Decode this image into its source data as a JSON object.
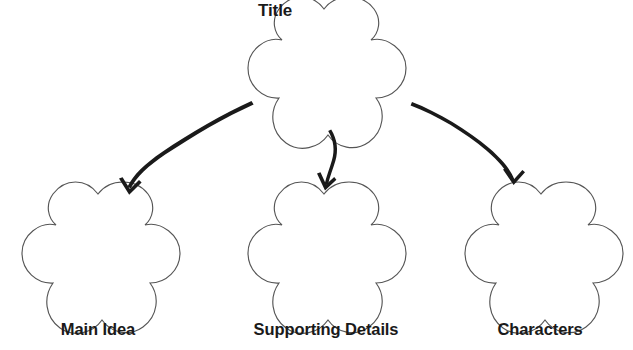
{
  "diagram": {
    "type": "graphic-organizer",
    "shape_style": "five-petal-flower",
    "background_color": "#ffffff",
    "outline_color": "#555555",
    "text_color": "#1a1a1a",
    "arrow_color": "#1a1a1a",
    "nodes": [
      {
        "id": "title",
        "label": "Title",
        "label_position": "upper-left-outside",
        "center_x": 324,
        "center_y": 71,
        "radius": 62
      },
      {
        "id": "main-idea",
        "label": "Main Idea",
        "label_position": "below",
        "center_x": 98,
        "center_y": 256,
        "radius": 63
      },
      {
        "id": "supporting-details",
        "label": "Supporting Details",
        "label_position": "below",
        "center_x": 324,
        "center_y": 256,
        "radius": 63
      },
      {
        "id": "characters",
        "label": "Characters",
        "label_position": "below",
        "center_x": 541,
        "center_y": 256,
        "radius": 63
      }
    ],
    "connections": [
      {
        "id": "arrow-title-to-main-idea",
        "from": "title",
        "to": "main-idea",
        "style": "curved-tapered",
        "direction": "down-left"
      },
      {
        "id": "arrow-title-to-supporting-details",
        "from": "title",
        "to": "supporting-details",
        "style": "curved-tapered",
        "direction": "down"
      },
      {
        "id": "arrow-title-to-characters",
        "from": "title",
        "to": "characters",
        "style": "curved-tapered",
        "direction": "down-right"
      }
    ]
  }
}
